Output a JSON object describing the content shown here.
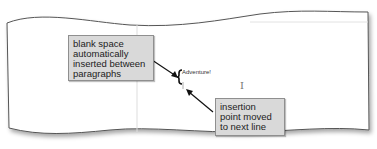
{
  "callouts": {
    "blank_space": [
      "blank space",
      "automatically",
      "inserted between",
      "paragraphs"
    ],
    "insertion_point": [
      "insertion",
      "point moved",
      "to next line"
    ]
  },
  "document": {
    "text": "Adventure!",
    "cursor_icon": "I"
  }
}
